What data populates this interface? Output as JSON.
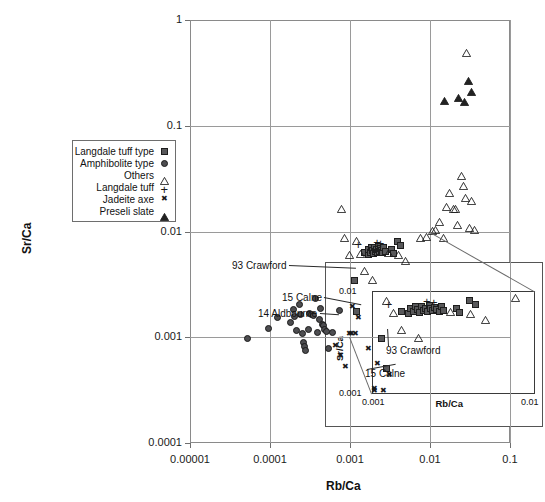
{
  "chart_data": {
    "type": "scatter",
    "title": "",
    "xlabel": "Rb/Ca",
    "ylabel": "Sr/Ca",
    "xscale": "log",
    "yscale": "log",
    "xlim": [
      1e-05,
      0.1
    ],
    "ylim": [
      0.0001,
      1
    ],
    "xticks": [
      "0.00001",
      "0.0001",
      "0.001",
      "0.01",
      "0.1"
    ],
    "yticks": [
      "1",
      "0.1",
      "0.01",
      "0.001",
      "0.0001"
    ],
    "grid": true,
    "legend_position": "upper-left-inside",
    "series": [
      {
        "name": "Langdale tuff type",
        "marker": "filled-square",
        "points": [
          [
            0.00115,
            0.00345
          ],
          [
            0.00122,
            0.00175
          ],
          [
            0.00152,
            0.0063
          ],
          [
            0.00168,
            0.006
          ],
          [
            0.00172,
            0.0068
          ],
          [
            0.0018,
            0.0063
          ],
          [
            0.00186,
            0.0071
          ],
          [
            0.00191,
            0.0066
          ],
          [
            0.00196,
            0.0062
          ],
          [
            0.00202,
            0.007
          ],
          [
            0.00208,
            0.0065
          ],
          [
            0.00214,
            0.0068
          ],
          [
            0.00219,
            0.0063
          ],
          [
            0.00224,
            0.0072
          ],
          [
            0.0023,
            0.0067
          ],
          [
            0.00236,
            0.0064
          ],
          [
            0.00242,
            0.0069
          ],
          [
            0.0025,
            0.0066
          ],
          [
            0.00258,
            0.0063
          ],
          [
            0.00266,
            0.007
          ],
          [
            0.00275,
            0.0065
          ],
          [
            0.0033,
            0.0068
          ],
          [
            0.00345,
            0.0062
          ],
          [
            0.00395,
            0.008
          ],
          [
            0.00432,
            0.0074
          ]
        ]
      },
      {
        "name": "Amphibolite type",
        "marker": "filled-circle",
        "points": [
          [
            5.2e-05,
            0.00097
          ],
          [
            9.6e-05,
            0.0012
          ],
          [
            0.000125,
            0.00155
          ],
          [
            0.000178,
            0.00137
          ],
          [
            0.000195,
            0.00182
          ],
          [
            0.000205,
            0.00158
          ],
          [
            0.000215,
            0.00115
          ],
          [
            0.000232,
            0.00205
          ],
          [
            0.000244,
            0.00163
          ],
          [
            0.000252,
            0.00108
          ],
          [
            0.000262,
            0.00089
          ],
          [
            0.00027,
            0.00081
          ],
          [
            0.000278,
            0.00075
          ],
          [
            0.0003,
            0.00118
          ],
          [
            0.000315,
            0.00168
          ],
          [
            0.00033,
            0.00164
          ],
          [
            0.000345,
            0.00161
          ],
          [
            0.000372,
            0.00235
          ],
          [
            0.000392,
            0.0011
          ],
          [
            0.00041,
            0.00148
          ],
          [
            0.000432,
            0.00186
          ],
          [
            0.000448,
            0.00132
          ],
          [
            0.000465,
            0.00128
          ],
          [
            0.000486,
            0.00118
          ],
          [
            0.000505,
            0.00113
          ],
          [
            0.00054,
            0.00078
          ],
          [
            0.0006,
            0.0011
          ],
          [
            0.00074,
            0.0018
          ]
        ]
      },
      {
        "name": "Others",
        "marker": "open-triangle",
        "points": [
          [
            0.00079,
            0.0185
          ],
          [
            0.00086,
            0.0098
          ],
          [
            0.000985,
            0.0068
          ],
          [
            0.00122,
            0.0092
          ],
          [
            0.00135,
            0.007
          ],
          [
            0.00152,
            0.0048
          ],
          [
            0.00192,
            0.004
          ],
          [
            0.00305,
            0.0072
          ],
          [
            0.00402,
            0.0069
          ],
          [
            0.005,
            0.006
          ],
          [
            0.0076,
            0.0098
          ],
          [
            0.00905,
            0.0102
          ],
          [
            0.0108,
            0.0115
          ],
          [
            0.0118,
            0.0118
          ],
          [
            0.0132,
            0.014
          ],
          [
            0.0148,
            0.01
          ],
          [
            0.0163,
            0.0195
          ],
          [
            0.0176,
            0.0262
          ],
          [
            0.0196,
            0.0185
          ],
          [
            0.0206,
            0.0185
          ],
          [
            0.0222,
            0.0132
          ],
          [
            0.0248,
            0.038
          ],
          [
            0.0264,
            0.031
          ],
          [
            0.0275,
            0.0238
          ],
          [
            0.033,
            0.0222
          ],
          [
            0.0308,
            0.0122
          ],
          [
            0.036,
            0.0118
          ],
          [
            0.029,
            0.56
          ]
        ]
      },
      {
        "name": "Langdale tuff",
        "marker": "plus",
        "points": [
          [
            0.00126,
            0.0078
          ],
          [
            0.00216,
            0.0083
          ],
          [
            0.00238,
            0.008
          ]
        ]
      },
      {
        "name": "Jadeite axe",
        "marker": "cross-x",
        "points": [
          [
            0.000655,
            0.00082
          ],
          [
            0.00076,
            0.00066
          ],
          [
            0.00088,
            0.00052
          ],
          [
            0.000985,
            0.00108
          ],
          [
            0.00104,
            0.00108
          ],
          [
            0.00108,
            0.00195
          ],
          [
            0.00118,
            0.00108
          ],
          [
            0.00128,
            0.00152
          ],
          [
            0.00168,
            0.00078
          ],
          [
            0.002,
            0.000325
          ]
        ]
      },
      {
        "name": "Preseli slate",
        "marker": "filled-triangle",
        "points": [
          [
            0.015,
            0.195
          ],
          [
            0.0228,
            0.21
          ],
          [
            0.0268,
            0.19
          ],
          [
            0.03,
            0.305
          ],
          [
            0.033,
            0.238
          ]
        ]
      }
    ],
    "annotations": [
      {
        "text": "93 Crawford",
        "x": 0.00118,
        "y": 0.00455
      },
      {
        "text": "15 Calne",
        "x": 0.00138,
        "y": 0.00205
      },
      {
        "text": "14 Aldbourne",
        "x": 0.00073,
        "y": 0.00165
      }
    ],
    "inset": {
      "xlabel": "Rb/Ca",
      "ylabel": "Sr/Ca",
      "xlim": [
        0.001,
        0.01
      ],
      "ylim": [
        0.001,
        0.01
      ],
      "xticks": [
        "0.001",
        "0.01"
      ],
      "yticks": [
        "0.001",
        "0.01"
      ],
      "annotations": [
        {
          "text": "93 Crawford"
        },
        {
          "text": "15 Calne"
        }
      ]
    }
  },
  "legend": {
    "items": [
      {
        "label": "Langdale tuff type",
        "marker": "filled-square"
      },
      {
        "label": "Amphibolite type",
        "marker": "filled-circle"
      },
      {
        "label": "Others",
        "marker": "open-triangle"
      },
      {
        "label": "Langdale tuff",
        "marker": "plus"
      },
      {
        "label": "Jadeite axe",
        "marker": "cross-x"
      },
      {
        "label": "Preseli slate",
        "marker": "filled-triangle"
      }
    ]
  },
  "colors": {
    "marker_fill": "#58585a",
    "marker_edge": "#1d1d1d",
    "axis": "#8a8a8a",
    "grid": "#9a9a9a",
    "text": "#111111"
  }
}
